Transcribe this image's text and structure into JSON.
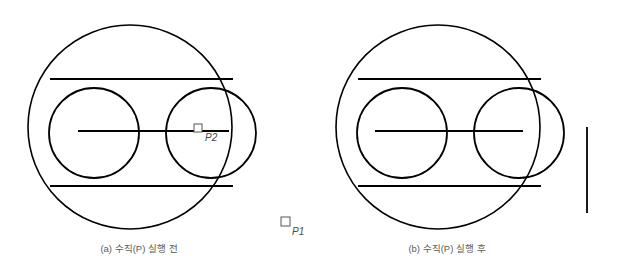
{
  "figure": {
    "background_color": "#ffffff",
    "stroke_color": "#000000",
    "caption_color": "#5a5a5a",
    "marker_color": "#555555"
  },
  "panels": [
    {
      "id": "panel-a",
      "caption": "(a) 수직(P) 실행 전",
      "caption_x": 139,
      "caption_y": 252,
      "big_circle": {
        "cx": 130,
        "cy": 127,
        "r": 102,
        "stroke_width": 1.6
      },
      "small_circles": [
        {
          "name": "left-cylinder-cap",
          "cx": 94,
          "cy": 133,
          "r": 45,
          "stroke_width": 1.8
        },
        {
          "name": "right-cylinder-cap",
          "cx": 211,
          "cy": 133,
          "r": 45,
          "stroke_width": 1.8
        }
      ],
      "tangent_lines": [
        {
          "name": "top-tangent",
          "x1": 50,
          "y1": 79,
          "x2": 233,
          "y2": 79,
          "stroke_width": 1.8
        },
        {
          "name": "bottom-tangent",
          "x1": 50,
          "y1": 186,
          "x2": 233,
          "y2": 186,
          "stroke_width": 1.8
        }
      ],
      "axis_line": {
        "x1": 78,
        "y1": 131,
        "x2": 229,
        "y2": 131,
        "stroke_width": 1.8
      },
      "vertical_line": null,
      "markers": [
        {
          "name": "point-p2",
          "label": "P2",
          "box_x": 194,
          "box_y": 124,
          "box_size": 8,
          "label_x": 205,
          "label_y": 141
        },
        {
          "name": "point-p1",
          "label": "P1",
          "box_x": 281,
          "box_y": 217,
          "box_size": 9,
          "label_x": 292,
          "label_y": 235
        }
      ]
    },
    {
      "id": "panel-b",
      "caption": "(b) 수직(P) 실행 후",
      "caption_x": 447,
      "caption_y": 252,
      "big_circle": {
        "cx": 438,
        "cy": 127,
        "r": 102,
        "stroke_width": 1.6
      },
      "small_circles": [
        {
          "name": "left-cylinder-cap",
          "cx": 402,
          "cy": 133,
          "r": 45,
          "stroke_width": 1.8
        },
        {
          "name": "right-cylinder-cap",
          "cx": 519,
          "cy": 133,
          "r": 45,
          "stroke_width": 1.8
        }
      ],
      "tangent_lines": [
        {
          "name": "top-tangent",
          "x1": 358,
          "y1": 79,
          "x2": 541,
          "y2": 79,
          "stroke_width": 1.8
        },
        {
          "name": "bottom-tangent",
          "x1": 358,
          "y1": 186,
          "x2": 541,
          "y2": 186,
          "stroke_width": 1.8
        }
      ],
      "axis_line": {
        "x1": 375,
        "y1": 131,
        "x2": 523,
        "y2": 131,
        "stroke_width": 1.8
      },
      "vertical_line": {
        "name": "perpendicular-reference-line",
        "x1": 587,
        "y1": 127,
        "x2": 587,
        "y2": 213,
        "stroke_width": 1.8
      },
      "markers": []
    }
  ]
}
